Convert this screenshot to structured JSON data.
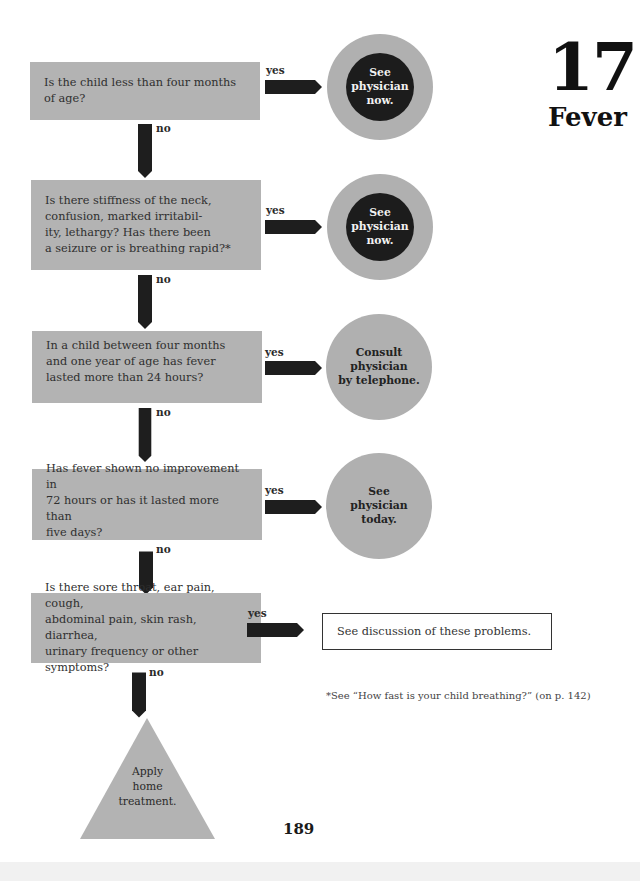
{
  "chapter": {
    "number": "17",
    "title": "Fever"
  },
  "labels": {
    "yes": "yes",
    "no": "no"
  },
  "colors": {
    "question_box": "#b3b3b3",
    "outer_circle": "#b0b0b0",
    "inner_circle": "#1c1c1c",
    "arrow": "#1e1e1e"
  },
  "steps": [
    {
      "question": "Is the child less than four months\nof age?",
      "yes_outcome": "See\nphysician\nnow.",
      "outcome_style": "urgent"
    },
    {
      "question": "Is there stiffness of the neck,\nconfusion, marked irritabil-\nity, lethargy? Has there been\na seizure or is breathing rapid?*",
      "yes_outcome": "See\nphysician\nnow.",
      "outcome_style": "urgent"
    },
    {
      "question": "In a child between four months\nand one year of age has fever\nlasted more than 24 hours?",
      "yes_outcome": "Consult\nphysician\nby telephone.",
      "outcome_style": "normal"
    },
    {
      "question": "Has fever shown no improvement in\n72 hours or has it lasted more than\nfive days?",
      "yes_outcome": "See\nphysician\ntoday.",
      "outcome_style": "normal"
    },
    {
      "question": "Is there sore throat, ear pain, cough,\nabdominal pain, skin rash, diarrhea,\nurinary frequency or other symptoms?",
      "yes_outcome": "See discussion of these problems.",
      "outcome_style": "box"
    }
  ],
  "final_outcome": "Apply\nhome\ntreatment.",
  "footnote": "*See “How fast is your child breathing?” (on p. 142)",
  "page_number": "189"
}
